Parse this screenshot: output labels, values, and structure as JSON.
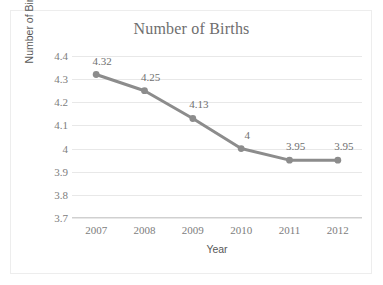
{
  "chart_data": {
    "type": "line",
    "title": "Number of Births",
    "xlabel": "Year",
    "ylabel": "Number of Births (in millions)",
    "categories": [
      "2007",
      "2008",
      "2009",
      "2010",
      "2011",
      "2012"
    ],
    "values": [
      4.32,
      4.25,
      4.13,
      4,
      3.95,
      3.95
    ],
    "point_labels": [
      "4.32",
      "4.25",
      "4.13",
      "4",
      "3.95",
      "3.95"
    ],
    "ylim": [
      3.7,
      4.4
    ],
    "yticks": [
      "4.4",
      "4.3",
      "4.2",
      "4.1",
      "4",
      "3.9",
      "3.8",
      "3.7"
    ],
    "ytick_values": [
      4.4,
      4.3,
      4.2,
      4.1,
      4.0,
      3.9,
      3.8,
      3.7
    ],
    "grid": true,
    "legend": false,
    "series_color": "#8c8c8c",
    "marker_color": "#8c8c8c",
    "gridline_color": "#e8e8e8",
    "text_color": "#7d7d7d",
    "title_color": "#6e6e6e",
    "background_color": "#ffffff",
    "border_color": "#ededed"
  }
}
